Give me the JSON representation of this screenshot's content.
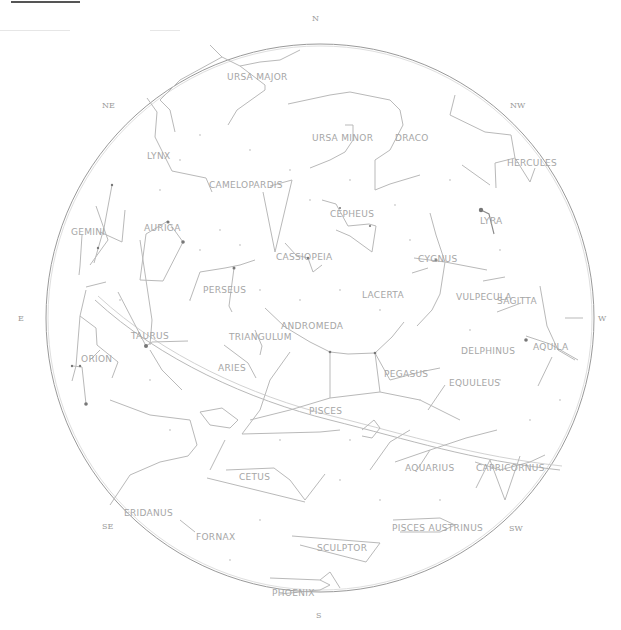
{
  "chart": {
    "title_bar": "",
    "compass": {
      "N": "N",
      "NE": "NE",
      "NW": "NW",
      "E": "E",
      "W": "W",
      "SE": "SE",
      "SW": "SW",
      "S": "S"
    },
    "constellations": [
      {
        "name": "URSA MAJOR",
        "x": 227,
        "y": 77
      },
      {
        "name": "URSA MINOR",
        "x": 312,
        "y": 141
      },
      {
        "name": "DRACO",
        "x": 395,
        "y": 141
      },
      {
        "name": "LYNX",
        "x": 147,
        "y": 157
      },
      {
        "name": "CAMELOPARDIS",
        "x": 209,
        "y": 187
      },
      {
        "name": "HERCULES",
        "x": 507,
        "y": 164
      },
      {
        "name": "LYRA",
        "x": 480,
        "y": 222
      },
      {
        "name": "CEPHEUS",
        "x": 330,
        "y": 215
      },
      {
        "name": "AURIGA",
        "x": 144,
        "y": 229
      },
      {
        "name": "GEMINI",
        "x": 71,
        "y": 233
      },
      {
        "name": "CASSIOPEIA",
        "x": 276,
        "y": 259
      },
      {
        "name": "CYGNUS",
        "x": 418,
        "y": 260
      },
      {
        "name": "PERSEUS",
        "x": 203,
        "y": 291
      },
      {
        "name": "LACERTA",
        "x": 362,
        "y": 296
      },
      {
        "name": "VULPECULA",
        "x": 456,
        "y": 298
      },
      {
        "name": "SAGITTA",
        "x": 497,
        "y": 302
      },
      {
        "name": "ANDROMEDA",
        "x": 281,
        "y": 327
      },
      {
        "name": "TAURUS",
        "x": 131,
        "y": 337
      },
      {
        "name": "TRIANGULUM",
        "x": 229,
        "y": 338
      },
      {
        "name": "DELPHINUS",
        "x": 461,
        "y": 352
      },
      {
        "name": "AQUILA",
        "x": 533,
        "y": 348
      },
      {
        "name": "ORION",
        "x": 81,
        "y": 360
      },
      {
        "name": "ARIES",
        "x": 218,
        "y": 369
      },
      {
        "name": "PEGASUS",
        "x": 384,
        "y": 375
      },
      {
        "name": "EQUULEUS",
        "x": 449,
        "y": 384
      },
      {
        "name": "PISCES",
        "x": 309,
        "y": 412
      },
      {
        "name": "AQUARIUS",
        "x": 405,
        "y": 469
      },
      {
        "name": "CAPRICORNUS",
        "x": 476,
        "y": 469
      },
      {
        "name": "CETUS",
        "x": 239,
        "y": 478
      },
      {
        "name": "ERIDANUS",
        "x": 124,
        "y": 514
      },
      {
        "name": "FORNAX",
        "x": 196,
        "y": 538
      },
      {
        "name": "PISCES AUSTRINUS",
        "x": 392,
        "y": 529
      },
      {
        "name": "SCULPTOR",
        "x": 317,
        "y": 549
      },
      {
        "name": "PHOENIX",
        "x": 272,
        "y": 594
      }
    ]
  }
}
